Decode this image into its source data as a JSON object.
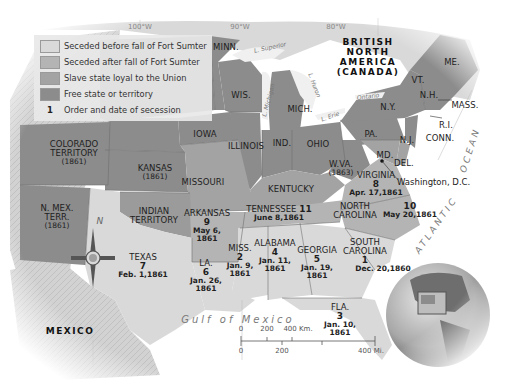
{
  "legend": {
    "items": [
      {
        "label": "Seceded before fall of Fort Sumter",
        "color": "#d9d9d9"
      },
      {
        "label": "Seceded after fall of Fort Sumter",
        "color": "#b4b4b4"
      },
      {
        "label": "Slave state loyal to the Union",
        "color": "#a3a3a3"
      },
      {
        "label": "Free state or territory",
        "color": "#8c8c8c"
      }
    ],
    "number_key": {
      "symbol": "1",
      "label": "Order and date of secession"
    }
  },
  "meridians": [
    "100°W",
    "90°W",
    "80°W"
  ],
  "countries": {
    "british_north_america": "BRITISH\nNORTH\nAMERICA\n(CANADA)",
    "mexico": "MEXICO"
  },
  "water": {
    "gulf": "Gulf of Mexico",
    "atlantic": "ATLANTIC",
    "ocean": "OCEAN",
    "lakes": [
      "L. Superior",
      "L. Michigan",
      "L. Huron",
      "Ontario",
      "L. Erie"
    ]
  },
  "states": {
    "minn": "MINN.",
    "wis": "WIS.",
    "mich": "MICH.",
    "iowa": "IOWA",
    "illinois": "ILLINOIS",
    "ind": "IND.",
    "ohio": "OHIO",
    "pa": "PA.",
    "ny": "N.Y.",
    "vt": "VT.",
    "nh": "N.H.",
    "me": "ME.",
    "mass": "MASS.",
    "ri": "R.I.",
    "conn": "CONN.",
    "nj": "N.J.",
    "md": "MD.",
    "del": "DEL.",
    "kansas": {
      "name": "KANSAS",
      "year": "(1861)"
    },
    "colorado": {
      "name": "COLORADO\nTERRITORY",
      "year": "(1861)"
    },
    "nmex": {
      "name": "N. MEX.\nTERR.",
      "year": "(1861)"
    },
    "wva": {
      "name": "W.VA.",
      "year": "(1863)"
    },
    "missouri": "MISSOURI",
    "kentucky": "KENTUCKY",
    "indian_territory": "INDIAN\nTERRITORY"
  },
  "seceded": [
    {
      "name": "SOUTH\nCAROLINA",
      "order": "1",
      "date": "Dec. 20,1860"
    },
    {
      "name": "MISS.",
      "order": "2",
      "date": "Jan. 9,\n1861"
    },
    {
      "name": "FLA.",
      "order": "3",
      "date": "Jan. 10,\n1861"
    },
    {
      "name": "ALABAMA",
      "order": "4",
      "date": "Jan. 11,\n1861"
    },
    {
      "name": "GEORGIA",
      "order": "5",
      "date": "Jan. 19,\n1861"
    },
    {
      "name": "LA.",
      "order": "6",
      "date": "Jan. 26,\n1861"
    },
    {
      "name": "TEXAS",
      "order": "7",
      "date": "Feb. 1,1861"
    },
    {
      "name": "VIRGINIA",
      "order": "8",
      "date": "Apr. 17,1861"
    },
    {
      "name": "ARKANSAS",
      "order": "9",
      "date": "May 6,\n1861"
    },
    {
      "name": "NORTH\nCAROLINA",
      "order": "10",
      "date": "May 20,1861"
    },
    {
      "name": "TENNESSEE",
      "order": "11",
      "date": "June 8,1861"
    }
  ],
  "washington_dc": "Washington, D.C.",
  "compass": {
    "north": "N"
  },
  "scale": {
    "km_ticks": [
      "0",
      "200",
      "400 Km."
    ],
    "mi_ticks": [
      "0",
      "200",
      "400 Mi."
    ]
  },
  "colors": {
    "free": "#8c8c8c",
    "border_loyal": "#a3a3a3",
    "seceded_after": "#b4b4b4",
    "seceded_before": "#d9d9d9",
    "foreign_land": "#dcdcdc",
    "water": "#ffffff"
  }
}
